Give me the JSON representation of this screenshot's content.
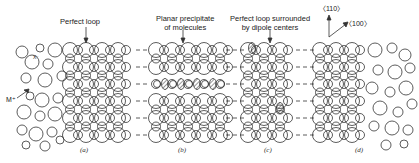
{
  "labels": {
    "perfect_loop": "Perfect loop",
    "planar_precipitate_line1": "Planar precipitate",
    "planar_precipitate_line2": "of molecules",
    "perfect_loop_dipole_line1": "Perfect loop surrounded",
    "perfect_loop_dipole_line2": "by dipole centers",
    "anion": "X⁻",
    "cation": "M⁺",
    "dir_110": "〈110〉",
    "dir_100": "〈100〉"
  },
  "panels": [
    {
      "caption": "(a)"
    },
    {
      "caption": "(b)"
    },
    {
      "caption": "(c)"
    },
    {
      "caption": "(d)"
    }
  ],
  "colors": {
    "line": "#333333",
    "background": "#ffffff"
  }
}
